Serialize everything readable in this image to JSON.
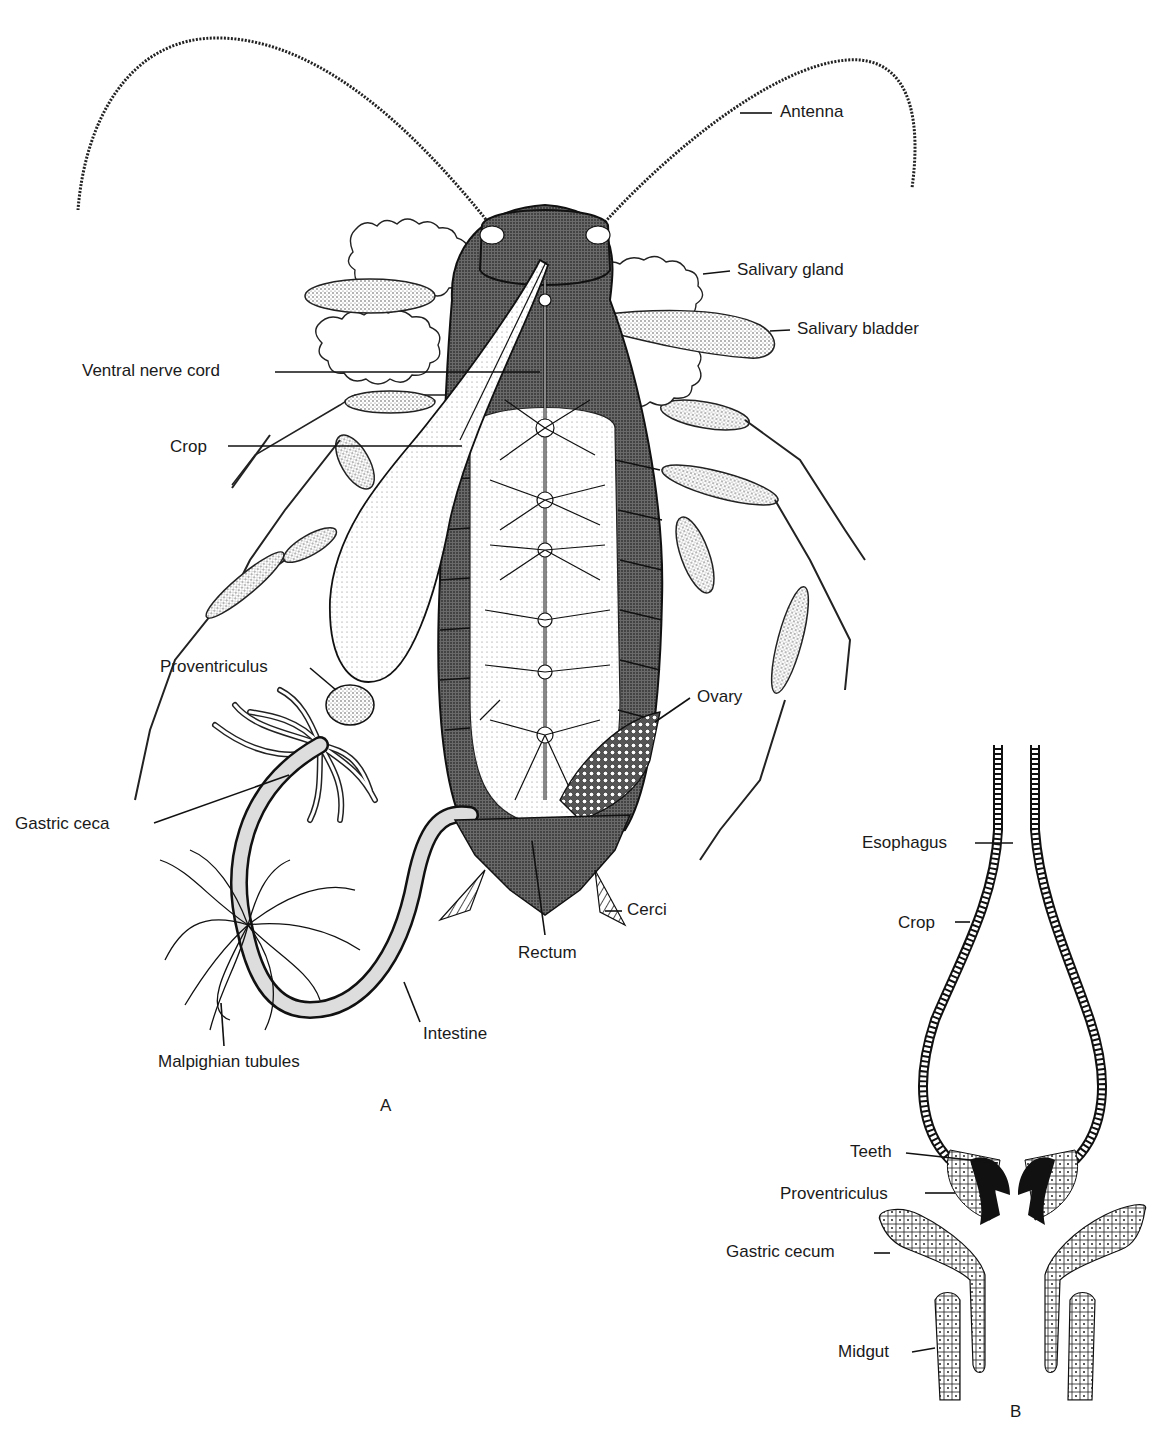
{
  "figure": {
    "panels": [
      {
        "id": "A",
        "letter": "A",
        "subject": "cockroach internal anatomy, ventral dissection",
        "labels": [
          {
            "key": "antenna",
            "text": "Antenna"
          },
          {
            "key": "salivary_gland",
            "text": "Salivary gland"
          },
          {
            "key": "salivary_bladder",
            "text": "Salivary bladder"
          },
          {
            "key": "ventral_nerve_cord",
            "text": "Ventral nerve cord"
          },
          {
            "key": "crop",
            "text": "Crop"
          },
          {
            "key": "proventriculus",
            "text": "Proventriculus"
          },
          {
            "key": "ovary",
            "text": "Ovary"
          },
          {
            "key": "gastric_ceca",
            "text": "Gastric ceca"
          },
          {
            "key": "cerci",
            "text": "Cerci"
          },
          {
            "key": "rectum",
            "text": "Rectum"
          },
          {
            "key": "intestine",
            "text": "Intestine"
          },
          {
            "key": "malpighian_tubules",
            "text": "Malpighian tubules"
          }
        ]
      },
      {
        "id": "B",
        "letter": "B",
        "subject": "longitudinal section of foregut",
        "labels": [
          {
            "key": "esophagus",
            "text": "Esophagus"
          },
          {
            "key": "crop",
            "text": "Crop"
          },
          {
            "key": "teeth",
            "text": "Teeth"
          },
          {
            "key": "proventriculus",
            "text": "Proventriculus"
          },
          {
            "key": "gastric_cecum",
            "text": "Gastric cecum"
          },
          {
            "key": "midgut",
            "text": "Midgut"
          }
        ]
      }
    ],
    "colors": {
      "ink": "#1a1a1a",
      "paper": "#ffffff",
      "shade": "#8a8a8a",
      "dark": "#2b2b2b"
    }
  }
}
